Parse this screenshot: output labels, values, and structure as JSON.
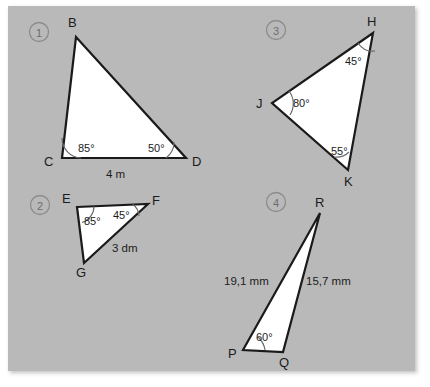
{
  "worksheet": {
    "background_color": "#b9b9b9",
    "shape_fill": "#ffffff",
    "stroke_color": "#1a1a1a",
    "badge_color": "#8c8c8c"
  },
  "problems": [
    {
      "number": "1",
      "vertices": [
        {
          "name": "B",
          "label": "B"
        },
        {
          "name": "C",
          "label": "C"
        },
        {
          "name": "D",
          "label": "D"
        }
      ],
      "angles": [
        {
          "at": "C",
          "label": "85°"
        },
        {
          "at": "D",
          "label": "50°"
        }
      ],
      "sides": [
        {
          "between": "CD",
          "label": "4 m"
        }
      ]
    },
    {
      "number": "2",
      "vertices": [
        {
          "name": "E",
          "label": "E"
        },
        {
          "name": "F",
          "label": "F"
        },
        {
          "name": "G",
          "label": "G"
        }
      ],
      "angles": [
        {
          "at": "E",
          "label": "85°"
        },
        {
          "at": "F",
          "label": "45°"
        }
      ],
      "sides": [
        {
          "between": "FG",
          "label": "3 dm"
        }
      ]
    },
    {
      "number": "3",
      "vertices": [
        {
          "name": "H",
          "label": "H"
        },
        {
          "name": "J",
          "label": "J"
        },
        {
          "name": "K",
          "label": "K"
        }
      ],
      "angles": [
        {
          "at": "H",
          "label": "45°"
        },
        {
          "at": "J",
          "label": "80°"
        },
        {
          "at": "K",
          "label": "55°"
        }
      ],
      "sides": []
    },
    {
      "number": "4",
      "vertices": [
        {
          "name": "R",
          "label": "R"
        },
        {
          "name": "P",
          "label": "P"
        },
        {
          "name": "Q",
          "label": "Q"
        }
      ],
      "angles": [
        {
          "at": "P",
          "label": "60°"
        }
      ],
      "sides": [
        {
          "between": "PR",
          "label": "19,1 mm"
        },
        {
          "between": "QR",
          "label": "15,7 mm"
        }
      ]
    }
  ]
}
